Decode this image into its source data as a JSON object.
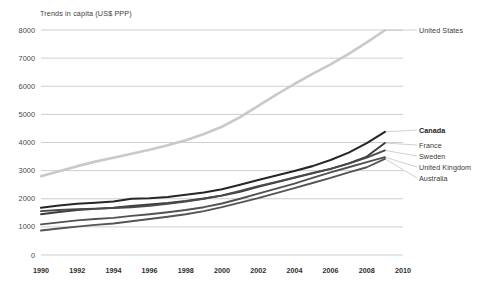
{
  "chart_data": {
    "type": "line",
    "title": "Trends in capita (US$ PPP)",
    "xlabel": "",
    "ylabel": "",
    "xlim": [
      1990,
      2010
    ],
    "ylim": [
      0,
      8000
    ],
    "grid": true,
    "legend_position": "right",
    "yticks": [
      0,
      1000,
      2000,
      3000,
      4000,
      5000,
      6000,
      7000,
      8000
    ],
    "xticks": [
      1990,
      1992,
      1994,
      1996,
      1998,
      2000,
      2002,
      2004,
      2006,
      2008,
      2010
    ],
    "x": [
      1990,
      1991,
      1992,
      1993,
      1994,
      1995,
      1996,
      1997,
      1998,
      1999,
      2000,
      2001,
      2002,
      2003,
      2004,
      2005,
      2006,
      2007,
      2008,
      2009
    ],
    "series": [
      {
        "name": "United States",
        "color": "#c9c9c9",
        "width": 2.6,
        "bold": false,
        "values": [
          2800,
          2980,
          3160,
          3320,
          3460,
          3600,
          3740,
          3900,
          4080,
          4300,
          4560,
          4900,
          5300,
          5700,
          6080,
          6440,
          6780,
          7150,
          7560,
          7990
        ]
      },
      {
        "name": "Canada",
        "color": "#262626",
        "width": 2.1,
        "bold": true,
        "values": [
          1680,
          1760,
          1820,
          1860,
          1900,
          2000,
          2020,
          2060,
          2140,
          2220,
          2340,
          2500,
          2670,
          2830,
          2990,
          3160,
          3380,
          3640,
          3980,
          4380
        ]
      },
      {
        "name": "France",
        "color": "#3d3d3d",
        "width": 1.9,
        "bold": false,
        "values": [
          1450,
          1530,
          1600,
          1640,
          1680,
          1740,
          1800,
          1850,
          1920,
          2010,
          2110,
          2250,
          2420,
          2580,
          2740,
          2900,
          3060,
          3260,
          3500,
          3980
        ]
      },
      {
        "name": "Sweden",
        "color": "#4a4a4a",
        "width": 1.9,
        "bold": false,
        "values": [
          1560,
          1600,
          1630,
          1650,
          1670,
          1700,
          1750,
          1820,
          1900,
          2000,
          2120,
          2280,
          2450,
          2600,
          2760,
          2920,
          3060,
          3250,
          3460,
          3720
        ]
      },
      {
        "name": "United Kingdom",
        "color": "#525252",
        "width": 1.9,
        "bold": false,
        "values": [
          1090,
          1160,
          1230,
          1280,
          1320,
          1390,
          1450,
          1520,
          1600,
          1700,
          1830,
          2000,
          2180,
          2360,
          2540,
          2740,
          2940,
          3120,
          3300,
          3480
        ]
      },
      {
        "name": "Australia",
        "color": "#555555",
        "width": 1.9,
        "bold": false,
        "values": [
          870,
          940,
          1010,
          1070,
          1120,
          1200,
          1280,
          1360,
          1450,
          1560,
          1700,
          1860,
          2020,
          2200,
          2380,
          2560,
          2740,
          2940,
          3120,
          3420
        ]
      }
    ],
    "legend_entries": [
      {
        "label": "United States",
        "bold": false
      },
      {
        "label": "Canada",
        "bold": true
      },
      {
        "label": "France",
        "bold": false
      },
      {
        "label": "Sweden",
        "bold": false
      },
      {
        "label": "United Kingdom",
        "bold": false
      },
      {
        "label": "Australia",
        "bold": false
      }
    ]
  }
}
